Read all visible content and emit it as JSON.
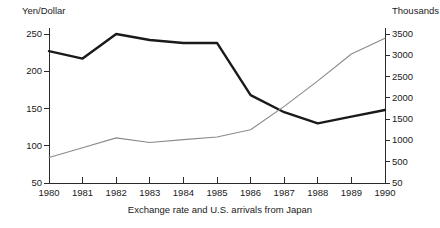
{
  "caption": "Exchange rate and U.S. arrivals from Japan",
  "left_axis": {
    "unit_label": "Yen/Dollar",
    "ticks": [
      "250",
      "200",
      "150",
      "100",
      "50"
    ]
  },
  "right_axis": {
    "unit_label": "Thousands",
    "ticks": [
      "3500",
      "3000",
      "2500",
      "2000",
      "1500",
      "1000",
      "500",
      "50"
    ]
  },
  "x_axis": {
    "ticks": [
      "1980",
      "1981",
      "1982",
      "1983",
      "1984",
      "1985",
      "1986",
      "1987",
      "1988",
      "1989",
      "1990"
    ]
  },
  "colors": {
    "exchange_rate_line": "#1a1a1a",
    "arrivals_line": "#8a8a8a",
    "axis": "#2b2b2b",
    "background": "#ffffff"
  },
  "chart_data": {
    "type": "line",
    "title": "",
    "subtitle": "",
    "xlabel": "Exchange rate and U.S. arrivals from Japan",
    "ylabel": "Yen/Dollar",
    "y2label": "Thousands",
    "grid": false,
    "legend_position": "none",
    "x": [
      1980,
      1981,
      1982,
      1983,
      1984,
      1985,
      1986,
      1987,
      1988,
      1989,
      1990
    ],
    "xtick_labels": [
      "1980",
      "1981",
      "1982",
      "1983",
      "1984",
      "1985",
      "1986",
      "1987",
      "1988",
      "1989",
      "1990"
    ],
    "ylim": [
      50,
      250
    ],
    "ytick_values": [
      50,
      100,
      150,
      200,
      250
    ],
    "y2lim": [
      50,
      3500
    ],
    "y2tick_values": [
      50,
      500,
      1000,
      1500,
      2000,
      2500,
      3000,
      3500
    ],
    "series": [
      {
        "name": "Exchange rate (Yen/Dollar)",
        "axis": "left",
        "color": "#1a1a1a",
        "line_width": 2.4,
        "values": [
          227,
          217,
          250,
          242,
          238,
          238,
          168,
          145,
          130,
          139,
          148
        ]
      },
      {
        "name": "U.S. arrivals from Japan (Thousands)",
        "axis": "right",
        "color": "#8a8a8a",
        "line_width": 1.1,
        "values": [
          600,
          830,
          1060,
          950,
          1020,
          1080,
          1250,
          1800,
          2400,
          3030,
          3400
        ]
      }
    ]
  }
}
